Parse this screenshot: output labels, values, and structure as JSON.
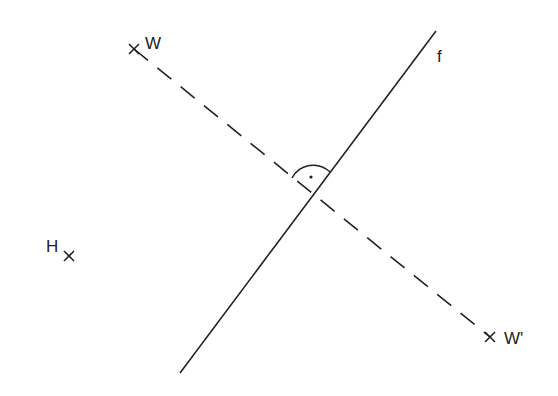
{
  "diagram": {
    "type": "geometric-reflection",
    "colors": {
      "stroke": "#222222",
      "background": "#ffffff"
    },
    "line_f": {
      "label": "f",
      "x1": 180,
      "y1": 373,
      "x2": 436,
      "y2": 31,
      "label_x": 437,
      "label_y": 62
    },
    "points": [
      {
        "id": "W",
        "label": "W",
        "x": 134,
        "y": 49,
        "label_x": 145,
        "label_y": 49
      },
      {
        "id": "W_prime",
        "label": "W'",
        "x": 490,
        "y": 337,
        "label_x": 504,
        "label_y": 344
      },
      {
        "id": "H",
        "label": "H",
        "x": 69,
        "y": 256,
        "label_x": 46,
        "label_y": 252
      }
    ],
    "segment_WWprime": {
      "style": "dashed",
      "from": "W",
      "to": "W'"
    },
    "right_angle_mark": {
      "cx": 313,
      "cy": 193,
      "dot_x": 311,
      "dot_y": 177
    }
  }
}
